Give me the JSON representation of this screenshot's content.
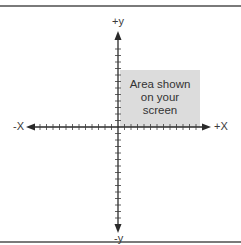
{
  "diagram": {
    "type": "cartesian-axes",
    "axes": {
      "x_positive_label": "+X",
      "x_negative_label": "-X",
      "y_positive_label": "+y",
      "y_negative_label": "-y"
    },
    "shaded_region": {
      "label_lines": [
        "Area shown",
        "on your",
        "screen"
      ],
      "quadrant": "upper-right",
      "fill_color": "#dcdcdc"
    },
    "colors": {
      "axis": "#2a2a2a",
      "frame": "#7a7a7a",
      "background": "#ffffff"
    }
  }
}
